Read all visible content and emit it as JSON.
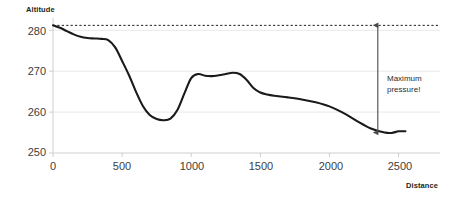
{
  "chart_data": {
    "type": "line",
    "title": "",
    "xlabel": "Distance",
    "ylabel": "Altitude",
    "xlim": [
      0,
      2800
    ],
    "ylim": [
      250,
      283
    ],
    "xticks": [
      0,
      500,
      1000,
      1500,
      2000,
      2500
    ],
    "yticks": [
      250,
      260,
      270,
      280
    ],
    "xtick_labels": [
      "0",
      "500",
      "1000",
      "1500",
      "2000",
      "2500"
    ],
    "ytick_labels": [
      "250",
      "260",
      "270",
      "280"
    ],
    "grid": "horizontal",
    "legend": "none",
    "series": [
      {
        "name": "Altitude profile",
        "color": "#1a1a1a",
        "x": [
          0,
          50,
          100,
          150,
          200,
          250,
          300,
          350,
          400,
          450,
          500,
          550,
          600,
          650,
          700,
          750,
          800,
          850,
          900,
          950,
          1000,
          1050,
          1100,
          1150,
          1200,
          1250,
          1300,
          1350,
          1400,
          1450,
          1500,
          1550,
          1600,
          1700,
          1800,
          1900,
          2000,
          2100,
          2200,
          2300,
          2400,
          2450,
          2500,
          2550
        ],
        "y": [
          281.2,
          280.6,
          279.8,
          279.0,
          278.4,
          278.1,
          278.0,
          277.9,
          277.6,
          275.8,
          272.5,
          269.0,
          265.0,
          261.5,
          259.3,
          258.3,
          258.0,
          258.4,
          260.5,
          264.5,
          268.3,
          269.3,
          268.9,
          268.8,
          269.0,
          269.3,
          269.6,
          269.3,
          267.9,
          265.9,
          264.8,
          264.3,
          264.0,
          263.6,
          263.1,
          262.4,
          261.4,
          259.8,
          257.8,
          256.0,
          255.0,
          254.9,
          255.3,
          255.3
        ]
      }
    ],
    "annotations": [
      {
        "name": "max-pressure-annotation",
        "label_line1": "Maximum",
        "label_line2": "pressure!",
        "type": "double-arrow",
        "x": 2350,
        "y_top": 281.2,
        "y_bottom": 255.0,
        "color": "#4a4a4a"
      },
      {
        "name": "reference-dashed-line",
        "type": "dashed-horizontal",
        "y": 281.2,
        "x_start": 0,
        "x_end": 2800,
        "color": "#1a1a1a"
      }
    ],
    "colors": {
      "line": "#1a1a1a",
      "grid": "#e8e8e8",
      "axis": "#cfcfcf",
      "text": "#3d3d3d",
      "annotation": "#4a4a4a",
      "background": "#ffffff"
    }
  }
}
